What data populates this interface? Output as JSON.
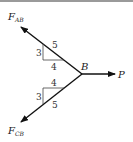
{
  "diagram": {
    "type": "free-body diagram",
    "point": {
      "label": "B"
    },
    "forces": [
      {
        "label": "F",
        "subscript": "AB",
        "direction": "up-left"
      },
      {
        "label": "F",
        "subscript": "CB",
        "direction": "down-left"
      },
      {
        "label": "P",
        "direction": "right"
      }
    ],
    "slope_triangles": [
      {
        "rise": "3",
        "run": "4",
        "hypotenuse": "5",
        "position": "upper"
      },
      {
        "rise": "3",
        "run": "4",
        "hypotenuse": "5",
        "position": "lower"
      }
    ]
  }
}
